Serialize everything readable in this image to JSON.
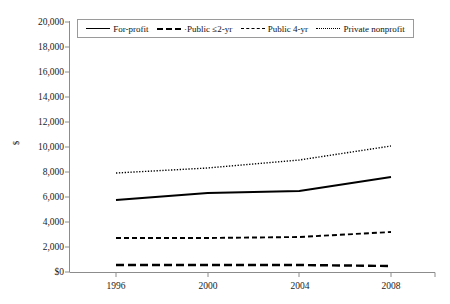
{
  "chart_data": {
    "type": "line",
    "title": "",
    "xlabel": "",
    "ylabel": "$",
    "categories": [
      "1996",
      "2000",
      "2004",
      "2008"
    ],
    "x": [
      1996,
      2000,
      2004,
      2008
    ],
    "ylim": [
      0,
      20000
    ],
    "ytick_labels": [
      "20,000",
      "18,000",
      "16,000",
      "14,000",
      "12,000",
      "10,000",
      "8,000",
      "6,000",
      "4,000",
      "2,000",
      "$0"
    ],
    "ytick_values": [
      20000,
      18000,
      16000,
      14000,
      12000,
      10000,
      8000,
      6000,
      4000,
      2000,
      0
    ],
    "grid": false,
    "legend_position": "top-inside",
    "series": [
      {
        "name": "For-profit",
        "style": "solid",
        "values": [
          5760,
          6320,
          6480,
          7600
        ]
      },
      {
        "name": "Public ≤2-yr",
        "style": "long-dash",
        "values": [
          560,
          560,
          560,
          480
        ]
      },
      {
        "name": "Public 4-yr",
        "style": "dash",
        "values": [
          2720,
          2720,
          2800,
          3200
        ]
      },
      {
        "name": "Private nonprofit",
        "style": "dotted",
        "values": [
          7920,
          8320,
          8960,
          10080
        ]
      }
    ]
  },
  "axis": {
    "y_title": "$",
    "y_labels": [
      "20,000",
      "18,000",
      "16,000",
      "14,000",
      "12,000",
      "10,000",
      "8,000",
      "6,000",
      "4,000",
      "2,000",
      "$0"
    ],
    "x_labels": [
      "1996",
      "2000",
      "2004",
      "2008"
    ]
  },
  "legend": {
    "items": [
      {
        "label": "For-profit",
        "style": "solid"
      },
      {
        "label": "·Public ≤2-yr",
        "style": "long-dash"
      },
      {
        "label": "Public 4-yr",
        "style": "dash"
      },
      {
        "label": "Private nonprofit",
        "style": "dotted"
      }
    ]
  },
  "colors": {
    "line": "#000000",
    "axis": "#8c8c8c",
    "text": "#1a1a1a",
    "background": "#ffffff"
  }
}
